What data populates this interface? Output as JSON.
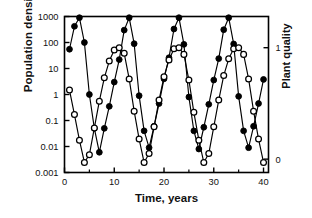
{
  "chart_data": {
    "type": "line",
    "title": "",
    "xlabel": "Time, years",
    "ylabel": "Population density",
    "ylabel_right": "Plant quality",
    "xlim": [
      0,
      41
    ],
    "xticks": [
      0,
      10,
      20,
      30,
      40
    ],
    "xticklabels": [
      "0",
      "10",
      "20",
      "30",
      "40"
    ],
    "yscale": "log",
    "ylim": [
      0.001,
      1000
    ],
    "yticks": [
      0.001,
      0.01,
      0.1,
      1,
      10,
      100,
      1000
    ],
    "yticklabels": [
      "0.001",
      "0.01",
      "0.1",
      "1",
      "10",
      "100",
      "1000"
    ],
    "ylim_right": [
      -0.12,
      1.28
    ],
    "yticks_right": [
      0,
      1
    ],
    "yticklabels_right": [
      "0",
      "1"
    ],
    "grid": false,
    "legend": "none",
    "series": [
      {
        "name": "Population density",
        "marker": "filled-circle",
        "axis": "left",
        "color": "#000000",
        "points": [
          [
            1.0,
            55
          ],
          [
            2.0,
            420
          ],
          [
            3.0,
            900
          ],
          [
            4.0,
            100
          ],
          [
            5.0,
            1.0
          ],
          [
            6.0,
            0.05
          ],
          [
            7.0,
            0.006
          ],
          [
            8.0,
            0.05
          ],
          [
            9.0,
            0.35
          ],
          [
            10.0,
            3.0
          ],
          [
            11.0,
            22
          ],
          [
            12.0,
            300
          ],
          [
            13.0,
            900
          ],
          [
            14.0,
            90
          ],
          [
            15.0,
            0.9
          ],
          [
            16.0,
            0.04
          ],
          [
            17.0,
            0.009
          ],
          [
            18.0,
            0.06
          ],
          [
            19.0,
            0.45
          ],
          [
            20.0,
            4.0
          ],
          [
            21.0,
            26
          ],
          [
            22.0,
            330
          ],
          [
            23.0,
            900
          ],
          [
            24.0,
            85
          ],
          [
            25.0,
            0.8
          ],
          [
            26.0,
            0.04
          ],
          [
            27.0,
            0.008
          ],
          [
            28.0,
            0.055
          ],
          [
            29.0,
            0.42
          ],
          [
            30.0,
            3.6
          ],
          [
            31.0,
            24
          ],
          [
            32.0,
            310
          ],
          [
            33.0,
            900
          ],
          [
            34.0,
            88
          ],
          [
            35.0,
            0.85
          ],
          [
            36.0,
            0.04
          ],
          [
            37.0,
            0.009
          ],
          [
            38.0,
            0.06
          ],
          [
            39.0,
            0.45
          ],
          [
            40.0,
            3.8
          ]
        ]
      },
      {
        "name": "Plant quality",
        "marker": "open-circle",
        "axis": "right",
        "color": "#000000",
        "points": [
          [
            1.0,
            0.62
          ],
          [
            2.0,
            0.4
          ],
          [
            3.0,
            0.17
          ],
          [
            4.0,
            -0.03
          ],
          [
            5.0,
            0.04
          ],
          [
            6.0,
            0.28
          ],
          [
            7.0,
            0.52
          ],
          [
            8.0,
            0.73
          ],
          [
            9.0,
            0.88
          ],
          [
            10.0,
            0.98
          ],
          [
            11.0,
            1.0
          ],
          [
            12.0,
            0.95
          ],
          [
            13.0,
            0.72
          ],
          [
            14.0,
            0.43
          ],
          [
            15.0,
            0.18
          ],
          [
            16.0,
            -0.03
          ],
          [
            17.0,
            0.05
          ],
          [
            18.0,
            0.29
          ],
          [
            19.0,
            0.53
          ],
          [
            20.0,
            0.74
          ],
          [
            21.0,
            0.89
          ],
          [
            22.0,
            0.99
          ],
          [
            23.0,
            1.0
          ],
          [
            24.0,
            0.94
          ],
          [
            25.0,
            0.71
          ],
          [
            26.0,
            0.42
          ],
          [
            27.0,
            0.17
          ],
          [
            28.0,
            -0.03
          ],
          [
            29.0,
            0.05
          ],
          [
            30.0,
            0.29
          ],
          [
            31.0,
            0.53
          ],
          [
            32.0,
            0.75
          ],
          [
            33.0,
            0.9
          ],
          [
            34.0,
            0.99
          ],
          [
            35.0,
            1.0
          ],
          [
            36.0,
            0.94
          ],
          [
            37.0,
            0.72
          ],
          [
            38.0,
            0.43
          ],
          [
            39.0,
            0.18
          ],
          [
            40.0,
            -0.03
          ]
        ]
      }
    ]
  }
}
